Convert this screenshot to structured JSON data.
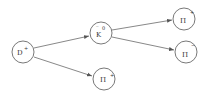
{
  "diagram": {
    "type": "particle-decay-tree",
    "nodes": [
      {
        "id": "dplus",
        "symbol": "D",
        "charge": "+",
        "bar": "",
        "cx": 23,
        "cy": 52
      },
      {
        "id": "k0bar",
        "symbol": "K",
        "charge": "0",
        "bar": "‾",
        "cx": 101,
        "cy": 33
      },
      {
        "id": "piplus1",
        "symbol": "Π",
        "charge": "+",
        "bar": "",
        "cx": 184,
        "cy": 19
      },
      {
        "id": "piminus",
        "symbol": "Π",
        "charge": "−",
        "bar": "",
        "cx": 186,
        "cy": 52
      },
      {
        "id": "piplus2",
        "symbol": "Π",
        "charge": "+",
        "bar": "",
        "cx": 104,
        "cy": 79
      }
    ],
    "edges": [
      {
        "from": "dplus",
        "to": "k0bar"
      },
      {
        "from": "dplus",
        "to": "piplus2"
      },
      {
        "from": "k0bar",
        "to": "piplus1"
      },
      {
        "from": "k0bar",
        "to": "piminus"
      }
    ]
  }
}
